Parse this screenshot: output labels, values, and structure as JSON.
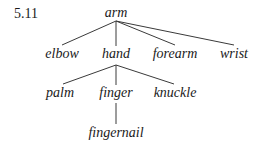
{
  "figure": {
    "number": "5.11"
  },
  "tree": {
    "root": "arm",
    "level1": [
      "elbow",
      "hand",
      "forearm",
      "wrist"
    ],
    "level2": [
      "palm",
      "finger",
      "knuckle"
    ],
    "level3": [
      "fingernail"
    ],
    "edges": [
      [
        "arm",
        "elbow"
      ],
      [
        "arm",
        "hand"
      ],
      [
        "arm",
        "forearm"
      ],
      [
        "arm",
        "wrist"
      ],
      [
        "hand",
        "palm"
      ],
      [
        "hand",
        "finger"
      ],
      [
        "hand",
        "knuckle"
      ],
      [
        "finger",
        "fingernail"
      ]
    ]
  }
}
